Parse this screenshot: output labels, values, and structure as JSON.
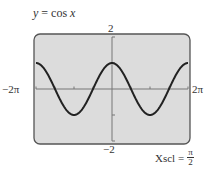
{
  "title": {
    "lhs": "y",
    "eq": "=",
    "rhs": "cos",
    "var": "x"
  },
  "chart_data": {
    "type": "line",
    "title": "y = cos x",
    "function": "cos(x)",
    "xlim": [
      -6.2832,
      6.2832
    ],
    "ylim": [
      -2,
      2
    ],
    "xlim_labels": [
      "−2π",
      "2π"
    ],
    "ylim_labels": [
      "2",
      "−2"
    ],
    "xscl_label": "Xscl =",
    "xscl_num": "π",
    "xscl_den": "2",
    "xscl": 1.5708,
    "yscl": 1,
    "series": [
      {
        "name": "cos x",
        "x": [
          -6.2832,
          -4.7124,
          -3.1416,
          -1.5708,
          0,
          1.5708,
          3.1416,
          4.7124,
          6.2832
        ],
        "y": [
          1,
          0,
          -1,
          0,
          1,
          0,
          -1,
          0,
          1
        ]
      }
    ],
    "grid": false,
    "colors": {
      "screen": "#dcdcdc",
      "frame": "#555555",
      "curve": "#222222",
      "axis": "#777777"
    }
  }
}
